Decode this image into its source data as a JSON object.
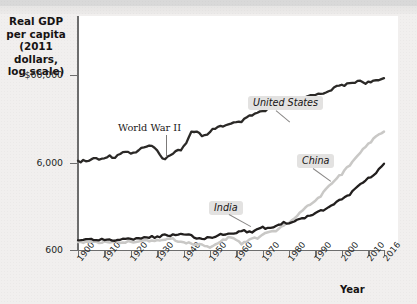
{
  "figure": {
    "background_color": "#f1efee",
    "plot_background": "#ffffff",
    "top_band_color": "#d9d9d9"
  },
  "axes": {
    "y_title": "Real GDP\nper capita\n(2011 dollars,\nlog scale)",
    "y_title_lines": [
      "Real GDP",
      "per capita",
      "(2011 dollars,",
      "log scale)"
    ],
    "x_title": "Year",
    "y_ticks": [
      {
        "label": "$60,000",
        "value": 60000,
        "y": 75
      },
      {
        "label": "6,000",
        "value": 6000,
        "y": 163
      },
      {
        "label": "600",
        "value": 600,
        "y": 250
      }
    ],
    "x_ticks": [
      {
        "label": "1900",
        "value": 1900
      },
      {
        "label": "1910",
        "value": 1910
      },
      {
        "label": "1920",
        "value": 1920
      },
      {
        "label": "1930",
        "value": 1930
      },
      {
        "label": "1940",
        "value": 1940
      },
      {
        "label": "1950",
        "value": 1950
      },
      {
        "label": "1960",
        "value": 1960
      },
      {
        "label": "1970",
        "value": 1970
      },
      {
        "label": "1980",
        "value": 1980
      },
      {
        "label": "1990",
        "value": 1990
      },
      {
        "label": "2000",
        "value": 2000
      },
      {
        "label": "2010",
        "value": 2010
      },
      {
        "label": "2016",
        "value": 2016
      }
    ]
  },
  "annotations": {
    "world_war_2": "World War II",
    "united_states": "United States",
    "china": "China",
    "india": "India"
  },
  "chart_data": {
    "type": "line",
    "title": "",
    "xlabel": "Year",
    "ylabel": "Real GDP per capita (2011 dollars, log scale)",
    "y_scale": "log",
    "ylim": [
      600,
      60000
    ],
    "xlim": [
      1900,
      2016
    ],
    "grid": false,
    "legend_position": "inline-callouts",
    "annotations": [
      {
        "text": "World War II",
        "x": 1941,
        "style": "serif-leader-line"
      },
      {
        "text": "United States",
        "x": 1978,
        "style": "italic-callout"
      },
      {
        "text": "China",
        "x": 1994,
        "style": "italic-callout"
      },
      {
        "text": "India",
        "x": 1968,
        "style": "italic-callout"
      }
    ],
    "series": [
      {
        "name": "United States",
        "color": "#2b2927",
        "x": [
          1900,
          1902,
          1904,
          1906,
          1908,
          1910,
          1912,
          1914,
          1916,
          1918,
          1920,
          1922,
          1924,
          1926,
          1928,
          1930,
          1932,
          1933,
          1935,
          1937,
          1939,
          1941,
          1943,
          1945,
          1947,
          1949,
          1951,
          1953,
          1955,
          1957,
          1959,
          1961,
          1963,
          1965,
          1967,
          1969,
          1971,
          1973,
          1975,
          1977,
          1979,
          1981,
          1983,
          1985,
          1987,
          1989,
          1991,
          1993,
          1995,
          1997,
          1999,
          2001,
          2003,
          2005,
          2007,
          2009,
          2011,
          2013,
          2016
        ],
        "values": [
          6100,
          6250,
          6200,
          6800,
          6400,
          6900,
          7100,
          6900,
          7700,
          8000,
          7700,
          7900,
          8600,
          9100,
          9100,
          8500,
          6600,
          6500,
          7300,
          8300,
          8400,
          10200,
          13300,
          13800,
          12000,
          12200,
          14200,
          15400,
          15800,
          16100,
          16900,
          17100,
          18400,
          20200,
          21400,
          22800,
          23200,
          25600,
          25000,
          27300,
          28800,
          29300,
          29500,
          32100,
          34000,
          36300,
          35900,
          37300,
          39700,
          42300,
          45400,
          46200,
          47500,
          50000,
          51800,
          48800,
          50000,
          50800,
          55200
        ]
      },
      {
        "name": "China",
        "color": "#c9c8c6",
        "x": [
          1900,
          1905,
          1910,
          1915,
          1920,
          1925,
          1930,
          1933,
          1936,
          1938,
          1940,
          1942,
          1945,
          1947,
          1950,
          1952,
          1955,
          1957,
          1960,
          1962,
          1965,
          1968,
          1970,
          1972,
          1975,
          1978,
          1980,
          1983,
          1985,
          1988,
          1990,
          1993,
          1995,
          1998,
          2000,
          2003,
          2005,
          2008,
          2010,
          2013,
          2016
        ],
        "values": [
          730,
          740,
          745,
          740,
          750,
          760,
          780,
          790,
          800,
          760,
          740,
          730,
          680,
          700,
          640,
          700,
          780,
          830,
          790,
          700,
          800,
          820,
          900,
          940,
          1010,
          1120,
          1240,
          1500,
          1680,
          2000,
          2180,
          2700,
          3200,
          3900,
          4450,
          5600,
          6500,
          8400,
          9700,
          11800,
          13400
        ]
      },
      {
        "name": "India",
        "color": "#221f1e",
        "x": [
          1900,
          1905,
          1910,
          1915,
          1920,
          1925,
          1930,
          1933,
          1936,
          1938,
          1940,
          1942,
          1945,
          1947,
          1950,
          1953,
          1955,
          1958,
          1960,
          1963,
          1965,
          1968,
          1970,
          1973,
          1975,
          1978,
          1980,
          1983,
          1985,
          1988,
          1990,
          1993,
          1995,
          1998,
          2000,
          2003,
          2005,
          2008,
          2010,
          2013,
          2016
        ],
        "values": [
          780,
          790,
          800,
          780,
          800,
          830,
          850,
          880,
          900,
          890,
          900,
          880,
          820,
          800,
          840,
          880,
          900,
          930,
          960,
          990,
          960,
          1020,
          1080,
          1060,
          1130,
          1230,
          1200,
          1300,
          1380,
          1500,
          1620,
          1720,
          1900,
          2120,
          2300,
          2600,
          3000,
          3550,
          3950,
          4600,
          5800
        ]
      }
    ]
  }
}
